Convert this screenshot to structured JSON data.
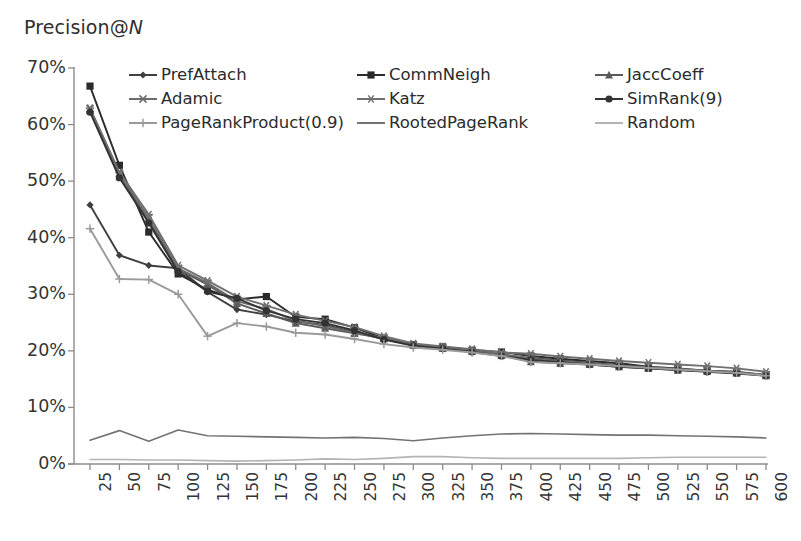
{
  "chart_data": {
    "type": "line",
    "title": "Precision@N",
    "xlabel": "",
    "ylabel": "Precision@N",
    "grid": false,
    "legend_position": "top-inside",
    "ylim": [
      0,
      70
    ],
    "ytick_labels": [
      "70%",
      "60%",
      "50%",
      "40%",
      "30%",
      "20%",
      "10%",
      "0%"
    ],
    "ytick_values": [
      70,
      60,
      50,
      40,
      30,
      20,
      10,
      0
    ],
    "x": [
      25,
      50,
      75,
      100,
      125,
      150,
      175,
      200,
      225,
      250,
      275,
      300,
      325,
      350,
      375,
      400,
      425,
      450,
      475,
      500,
      525,
      550,
      575,
      600
    ],
    "xtick_labels": [
      "25",
      "50",
      "75",
      "100",
      "125",
      "150",
      "175",
      "200",
      "225",
      "250",
      "275",
      "300",
      "325",
      "350",
      "375",
      "400",
      "425",
      "450",
      "475",
      "500",
      "525",
      "550",
      "575",
      "600"
    ],
    "series": [
      {
        "name": "PrefAttach",
        "marker": "diamond",
        "color": "#3f3f3f",
        "values": [
          45.8,
          36.9,
          35.1,
          34.6,
          30.4,
          27.3,
          26.4,
          25.2,
          24.6,
          23.3,
          22.1,
          21.1,
          20.6,
          19.9,
          19.3,
          18.7,
          18.3,
          17.9,
          17.4,
          17.0,
          16.7,
          16.4,
          16.1,
          15.7
        ]
      },
      {
        "name": "CommNeigh",
        "marker": "square",
        "color": "#2b2b2b",
        "values": [
          66.8,
          52.8,
          41.0,
          33.6,
          30.8,
          29.1,
          29.6,
          26.0,
          25.6,
          24.1,
          22.2,
          21.1,
          20.7,
          20.1,
          19.8,
          19.1,
          18.6,
          18.2,
          17.8,
          17.2,
          16.9,
          16.5,
          16.3,
          15.7
        ]
      },
      {
        "name": "JaccCoeff",
        "marker": "triangle",
        "color": "#5a5a5a",
        "values": [
          62.5,
          50.8,
          43.0,
          34.4,
          31.7,
          28.4,
          26.6,
          24.9,
          24.0,
          23.1,
          22.2,
          21.0,
          20.5,
          20.0,
          19.2,
          18.1,
          17.8,
          17.6,
          17.2,
          16.9,
          16.6,
          16.4,
          16.1,
          15.6
        ]
      },
      {
        "name": "Adamic",
        "marker": "cross",
        "color": "#6b6b6b",
        "values": [
          62.8,
          51.4,
          43.5,
          34.6,
          32.0,
          28.8,
          27.4,
          25.3,
          24.4,
          23.2,
          22.3,
          21.1,
          20.5,
          20.0,
          19.4,
          18.6,
          18.2,
          17.8,
          17.4,
          17.1,
          16.8,
          16.5,
          16.2,
          15.8
        ]
      },
      {
        "name": "Katz",
        "marker": "asterisk",
        "color": "#707070",
        "values": [
          62.9,
          51.6,
          44.1,
          35.1,
          32.4,
          29.6,
          28.0,
          26.4,
          25.3,
          24.2,
          22.6,
          21.3,
          20.8,
          20.3,
          19.7,
          19.5,
          19.0,
          18.6,
          18.2,
          17.9,
          17.6,
          17.3,
          16.9,
          16.3
        ]
      },
      {
        "name": "SimRank(9)",
        "marker": "circle",
        "color": "#333333",
        "values": [
          62.2,
          50.6,
          42.6,
          34.0,
          30.5,
          29.3,
          27.1,
          25.6,
          24.9,
          23.6,
          22.0,
          20.9,
          20.4,
          19.8,
          19.1,
          18.4,
          18.0,
          17.6,
          17.2,
          16.9,
          16.6,
          16.3,
          16.0,
          15.6
        ]
      },
      {
        "name": "PageRankProduct(0.9)",
        "marker": "plus",
        "color": "#9a9a9a",
        "values": [
          41.6,
          32.7,
          32.6,
          30.0,
          22.6,
          24.9,
          24.3,
          23.2,
          22.9,
          22.1,
          21.2,
          20.6,
          20.2,
          19.7,
          19.1,
          18.0,
          17.8,
          17.6,
          17.3,
          17.0,
          16.7,
          16.4,
          16.1,
          15.6
        ]
      },
      {
        "name": "RootedPageRank",
        "marker": "none",
        "color": "#737373",
        "values": [
          4.2,
          5.9,
          4.0,
          6.0,
          5.0,
          4.9,
          4.8,
          4.7,
          4.6,
          4.7,
          4.5,
          4.1,
          4.6,
          5.0,
          5.3,
          5.4,
          5.3,
          5.2,
          5.1,
          5.1,
          5.0,
          4.9,
          4.8,
          4.6
        ]
      },
      {
        "name": "Random",
        "marker": "none",
        "color": "#b4b4b4",
        "values": [
          0.8,
          0.8,
          0.7,
          0.7,
          0.6,
          0.5,
          0.6,
          0.7,
          0.9,
          0.8,
          1.0,
          1.3,
          1.3,
          1.1,
          1.0,
          1.0,
          1.0,
          1.0,
          1.0,
          1.1,
          1.2,
          1.2,
          1.2,
          1.2
        ]
      }
    ]
  },
  "legend": {
    "entries": [
      {
        "label": "PrefAttach",
        "marker": "diamond",
        "color": "#3f3f3f"
      },
      {
        "label": "CommNeigh",
        "marker": "square",
        "color": "#2b2b2b"
      },
      {
        "label": "JaccCoeff",
        "marker": "triangle",
        "color": "#5a5a5a"
      },
      {
        "label": "Adamic",
        "marker": "cross",
        "color": "#6b6b6b"
      },
      {
        "label": "Katz",
        "marker": "asterisk",
        "color": "#707070"
      },
      {
        "label": "SimRank(9)",
        "marker": "circle",
        "color": "#333333"
      },
      {
        "label": "PageRankProduct(0.9)",
        "marker": "plus",
        "color": "#9a9a9a"
      },
      {
        "label": "RootedPageRank",
        "marker": "none",
        "color": "#737373"
      },
      {
        "label": "Random",
        "marker": "none",
        "color": "#b4b4b4"
      }
    ]
  },
  "colors": {
    "axis": "#8c8c8c",
    "text": "#2e2e2e",
    "background": "#ffffff"
  },
  "title_parts": {
    "main": "Precision@",
    "italic": "N"
  }
}
